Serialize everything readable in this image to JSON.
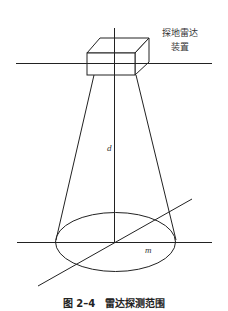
{
  "figure": {
    "device_label_line1": "探地雷达",
    "device_label_line2": "装置",
    "depth_var": "d",
    "radius_var": "m",
    "caption_number": "图 2–4",
    "caption_title": "雷达探测范围"
  },
  "style": {
    "stroke": "#222222",
    "background": "#ffffff"
  }
}
